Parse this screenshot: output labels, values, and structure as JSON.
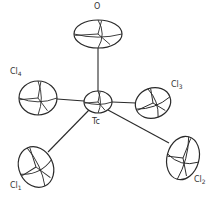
{
  "diagram": {
    "type": "ORTEP thermal ellipsoid plot",
    "colors": {
      "line": "#2a2a2a",
      "background": "#ffffff",
      "label": "#333333"
    },
    "atoms": [
      {
        "id": "O",
        "element": "O",
        "subscript": "",
        "cx": 98,
        "cy": 34,
        "rx": 24,
        "ry": 14,
        "rot": 0,
        "label_x": 94,
        "label_y": 3
      },
      {
        "id": "Tc",
        "element": "Tc",
        "subscript": "",
        "cx": 98,
        "cy": 102,
        "rx": 14,
        "ry": 11,
        "rot": 0,
        "label_x": 92,
        "label_y": 118
      },
      {
        "id": "Cl4",
        "element": "Cl",
        "subscript": "4",
        "cx": 38,
        "cy": 98,
        "rx": 19,
        "ry": 17,
        "rot": 0,
        "label_x": 10,
        "label_y": 68
      },
      {
        "id": "Cl3",
        "element": "Cl",
        "subscript": "3",
        "cx": 153,
        "cy": 103,
        "rx": 18,
        "ry": 15,
        "rot": -20,
        "label_x": 171,
        "label_y": 81
      },
      {
        "id": "Cl1",
        "element": "Cl",
        "subscript": "1",
        "cx": 36,
        "cy": 167,
        "rx": 17,
        "ry": 21,
        "rot": -25,
        "label_x": 10,
        "label_y": 182
      },
      {
        "id": "Cl2",
        "element": "Cl",
        "subscript": "2",
        "cx": 183,
        "cy": 158,
        "rx": 16,
        "ry": 22,
        "rot": 15,
        "label_x": 194,
        "label_y": 176
      }
    ],
    "bonds": [
      {
        "from": "Tc",
        "to": "O",
        "x1": 98,
        "y1": 91,
        "x2": 98,
        "y2": 48
      },
      {
        "from": "Tc",
        "to": "Cl4",
        "x1": 84,
        "y1": 101,
        "x2": 57,
        "y2": 99
      },
      {
        "from": "Tc",
        "to": "Cl3",
        "x1": 112,
        "y1": 102,
        "x2": 136,
        "y2": 103
      },
      {
        "from": "Tc",
        "to": "Cl1",
        "x1": 89,
        "y1": 110,
        "x2": 48,
        "y2": 152
      },
      {
        "from": "Tc",
        "to": "Cl2",
        "x1": 108,
        "y1": 110,
        "x2": 169,
        "y2": 143
      }
    ]
  }
}
